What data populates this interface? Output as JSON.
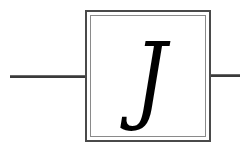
{
  "diagram": {
    "type": "block",
    "block": {
      "symbol": "J",
      "style": "double-bordered square",
      "border_color": "#4a4a4a"
    },
    "connections": [
      {
        "side": "left",
        "color": "#3a3a3a"
      },
      {
        "side": "right",
        "color": "#3a3a3a"
      }
    ]
  }
}
